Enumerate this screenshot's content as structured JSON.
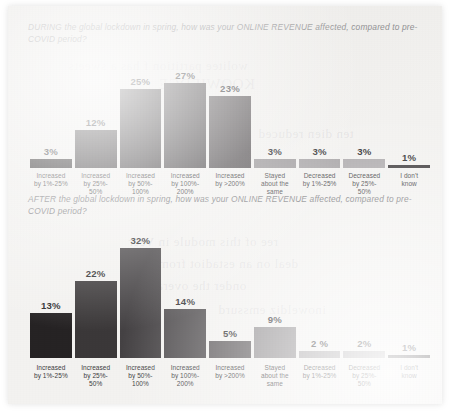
{
  "document": {
    "type": "scanned-report-page",
    "background_color": "#f3f2f0",
    "bleed_through_text": [
      "wolitee partition f has a sweets",
      "ten dien reduced",
      "ree of this module in Veer",
      "deal on an estadiot from",
      "onder the overall",
      "inoweldiz emssurd",
      "KOOWIEDGE"
    ]
  },
  "charts": [
    {
      "id": "during",
      "title": "DURING the global lockdown in spring, how was your ONLINE REVENUE affected, compared to pre-COVID period?"
    },
    {
      "id": "after",
      "title": "AFTER the global lockdown in spring, how was your ONLINE REVENUE affected, compared to pre-COVID period?"
    }
  ],
  "chart_data": [
    {
      "type": "bar",
      "title": "DURING the global lockdown in spring, how was your ONLINE REVENUE affected, compared to pre-COVID period?",
      "xlabel": "",
      "ylabel": "",
      "ylim": [
        0,
        35
      ],
      "grid": false,
      "legend": "none",
      "categories": [
        "Increased by 1%-25%",
        "Increased by 25%-50%",
        "Increased by 50%-100%",
        "Increased by 100%-200%",
        "Increased by >200%",
        "Stayed about the same",
        "Decreased by 1%-25%",
        "Decreased by 25%-50%",
        "I don't know"
      ],
      "values": [
        3,
        12,
        25,
        27,
        23,
        3,
        3,
        3,
        1
      ],
      "value_labels": [
        "3%",
        "12%",
        "25%",
        "27%",
        "23%",
        "3%",
        "3%",
        "3%",
        "1%"
      ],
      "bar_colors": [
        "#221f20",
        "#3a3739",
        "#454244",
        "#4f4c4e",
        "#5b5759",
        "#9d9a9c",
        "#a5a2a4",
        "#aeabad",
        "#3f3c3e"
      ]
    },
    {
      "type": "bar",
      "title": "AFTER the global lockdown in spring, how was your ONLINE REVENUE affected, compared to pre-COVID period?",
      "xlabel": "",
      "ylabel": "",
      "ylim": [
        0,
        35
      ],
      "grid": false,
      "legend": "none",
      "categories": [
        "Increased by 1%-25%",
        "Increased by 25%-50%",
        "Increased by 50%-100%",
        "Increased by 100%-200%",
        "Increased by >200%",
        "Stayed about the same",
        "Decreased by 1%-25%",
        "Decreased by 25%-50%",
        "I don't know"
      ],
      "values": [
        13,
        22,
        32,
        14,
        5,
        9,
        2,
        2,
        1
      ],
      "value_labels": [
        "13%",
        "22%",
        "32%",
        "14%",
        "5%",
        "9%",
        "2 %",
        "2%",
        "1%"
      ],
      "bar_colors": [
        "#262324",
        "#3b3839",
        "#454244",
        "#504d4f",
        "#5d595b",
        "#8f8c8e",
        "#a8a5a7",
        "#b0adaf",
        "#3f3c3e"
      ]
    }
  ],
  "axis_labels": {
    "cat_0_line1": "Increased",
    "cat_0_line2": "by 1%-25%",
    "cat_1_line1": "Increased",
    "cat_1_line2": "by 25%-",
    "cat_1_line3": "50%",
    "cat_2_line1": "Increased",
    "cat_2_line2": "by 50%-",
    "cat_2_line3": "100%",
    "cat_3_line1": "Increased",
    "cat_3_line2": "by 100%-",
    "cat_3_line3": "200%",
    "cat_4_line1": "Increased",
    "cat_4_line2": "by >200%",
    "cat_5_line1": "Stayed",
    "cat_5_line2": "about the",
    "cat_5_line3": "same",
    "cat_6_line1": "Decreased",
    "cat_6_line2": "by 1%-25%",
    "cat_7_line1": "Decreased",
    "cat_7_line2": "by 25%-",
    "cat_7_line3": "50%",
    "cat_8_line1": "I don't",
    "cat_8_line2": "know"
  }
}
